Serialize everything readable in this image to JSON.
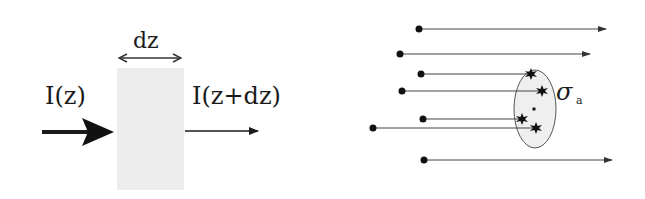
{
  "left_panel": {
    "slab_label": "dz",
    "incident_label": "I(z)",
    "transmitted_label": "I(z+dz)",
    "slab_color": "#ececec"
  },
  "right_panel": {
    "cross_section_symbol": "σ",
    "cross_section_subscript": "a",
    "particles": [
      {
        "x0": 419,
        "y": 29,
        "x1": 606,
        "absorbed": false
      },
      {
        "x0": 400,
        "y": 54,
        "x1": 590,
        "absorbed": false
      },
      {
        "x0": 421,
        "y": 74,
        "x1": 531,
        "absorbed": true
      },
      {
        "x0": 402,
        "y": 91,
        "x1": 542,
        "absorbed": true
      },
      {
        "x0": 423,
        "y": 119,
        "x1": 522,
        "absorbed": true
      },
      {
        "x0": 373,
        "y": 128,
        "x1": 536,
        "absorbed": true
      },
      {
        "x0": 424,
        "y": 160,
        "x1": 612,
        "absorbed": false
      }
    ],
    "ellipse_fill": "#efefef"
  }
}
